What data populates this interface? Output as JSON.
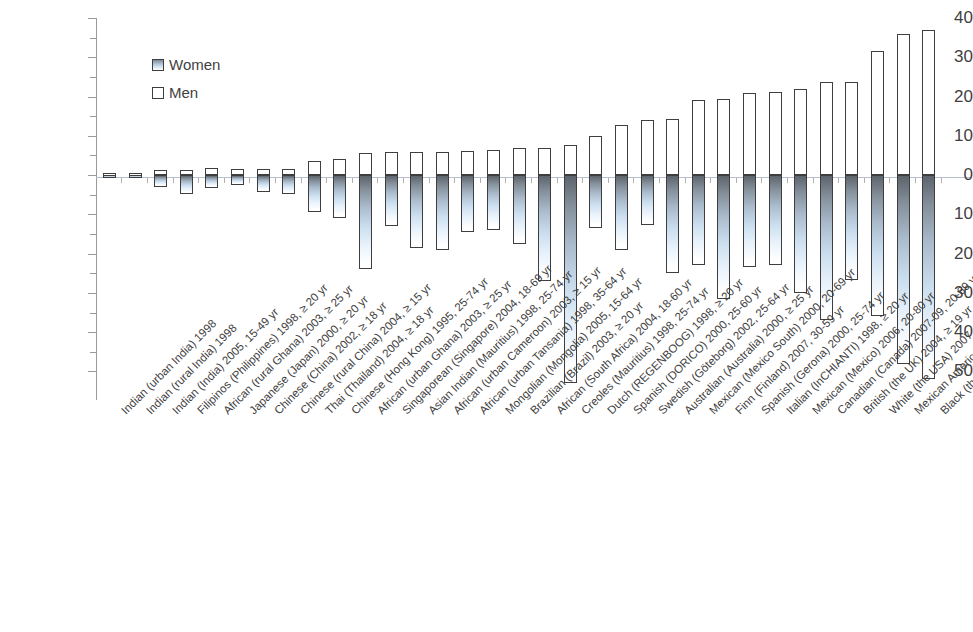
{
  "chart_data": {
    "type": "bar",
    "title": "",
    "subtitle": "",
    "xlabel": "",
    "ylabel": "",
    "orientation": "vertical",
    "grid": false,
    "legend_position": "top-left",
    "yaxis": {
      "tick_labels": [
        "40",
        "30",
        "20",
        "10",
        "0",
        "10",
        "20",
        "30",
        "40",
        "50"
      ],
      "tick_values": [
        40,
        30,
        20,
        10,
        0,
        -10,
        -20,
        -30,
        -40,
        -50
      ],
      "ylim": [
        -57,
        40
      ],
      "note": "Negative axis is labelled with positive numbers (absolute values)"
    },
    "legend": [
      {
        "name": "Women",
        "fill": "gradient-blue-gray"
      },
      {
        "name": "Men",
        "fill": "white"
      }
    ],
    "categories": [
      "Indian (urban India) 1998",
      "Indian (rural India) 1998",
      "Indian (India) 2005, 15-49 yr",
      "Filipinos (Philippines) 1998, ≥ 20 yr",
      "African (rural Ghana) 2003, ≥ 25 yr",
      "Japanese (Japan) 2000, ≥ 20 yr",
      "Chinese (China) 2002, ≥ 18 yr",
      "Chinese (rural China) 2004, ≥ 15 yr",
      "Thai (Thailand) 2004, ≥ 18 yr",
      "Chinese (Hong Kong) 1995, 25-74 yr",
      "African (urban Ghana) 2003, ≥ 25 yr",
      "Singaporean (Singapore) 2004, 18-69 yr",
      "Asian Indian (Mauritius) 1998, 25-74 yr",
      "African (urban Cameroon) 2003, ≥ 15 yr",
      "African (urban Tansania) 1998, 35-64 yr",
      "Mongolian (Mongolia) 2005, 15-64 yr",
      "Brazilian (Brazil) 2003, ≥ 20 yr",
      "African (South Africa) 2004, 18-60 yr",
      "Creoles (Mauritius) 1998, 25-74 yr",
      "Dutch (REGENBOOG) 1998, ≥ 20 yr",
      "Spanish (DORICO) 2000, 25-60 yr",
      "Swedish (Göteborg) 2002, 25-64 yr",
      "Australian (Australia) 2000, ≥ 25 yr",
      "Mexican (Mexico South) 2000, 20-69 yr",
      "Finn (Finland) 2007, 30-59 yr",
      "Spanish (Gerona) 2000, 25-74 yr",
      "Italian (InCHIANTI) 1998, ≥ 20 yr",
      "Mexican (Mexico) 2006, 20-80 yr",
      "Canadian (Canada) 2007-09, 20-69 yr",
      "British (the UK) 2004, ≥ 19 yr",
      "White (the USA) 2007, ≥ 20 yr",
      "Mexican American (the USA) 2007, ≥ 20 yr",
      "Black (the USA) 2007, ≥ 20 yr"
    ],
    "series": [
      {
        "name": "Men",
        "note": "positive values, plotted upward from zero",
        "values": [
          0.5,
          0.5,
          1.3,
          1.3,
          1.7,
          1.6,
          1.6,
          1.6,
          3.5,
          4.0,
          5.5,
          6.0,
          5.8,
          6.0,
          6.2,
          6.4,
          7.0,
          7.0,
          7.7,
          10.0,
          12.8,
          14.0,
          14.2,
          19.2,
          19.3,
          21.0,
          21.2,
          22.0,
          23.8,
          23.8,
          31.7,
          36.0,
          37.0
        ]
      },
      {
        "name": "Women",
        "note": "negative values, plotted downward from zero",
        "values": [
          -0.5,
          -0.5,
          -3.0,
          -4.8,
          -3.2,
          -2.5,
          -4.4,
          -4.7,
          -9.5,
          -11.0,
          -24.0,
          -13.0,
          -18.5,
          -19.0,
          -14.5,
          -14.0,
          -17.5,
          -27.0,
          -53.0,
          -13.5,
          -19.0,
          -12.6,
          -25.0,
          -23.0,
          -31.5,
          -23.5,
          -23.0,
          -30.0,
          -37.0,
          -26.8,
          -36.0,
          -48.0,
          -52.0
        ]
      }
    ]
  }
}
